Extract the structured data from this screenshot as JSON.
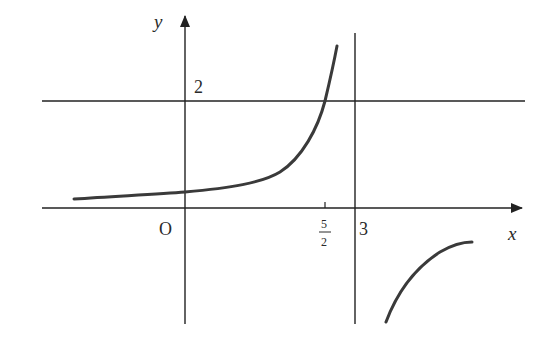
{
  "diagram": {
    "type": "function-graph",
    "axes": {
      "x_label": "x",
      "y_label": "y",
      "origin_label": "O"
    },
    "labels": {
      "y_tick_2": "2",
      "x_tick_3": "3",
      "x_tick_frac_num": "5",
      "x_tick_frac_den": "2"
    },
    "asymptotes": {
      "horizontal": {
        "y": 2
      },
      "vertical": {
        "x": 3
      }
    },
    "marked_points": [
      {
        "x": 2.5,
        "y": 2,
        "label": "5/2"
      }
    ],
    "curve_color": "#3a3a3a",
    "axis_color": "#222222"
  }
}
